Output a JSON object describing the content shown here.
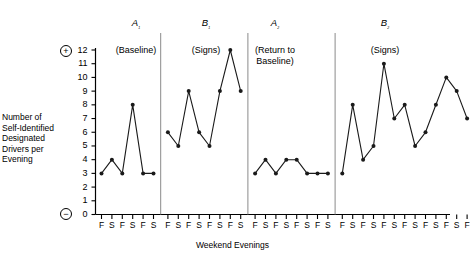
{
  "chart_data": {
    "type": "line",
    "title": "",
    "xlabel": "Weekend Evenings",
    "ylabel": "Number of Self-Identified Designated Drivers per Evening",
    "ylim": [
      0,
      12
    ],
    "yticks": [
      0,
      1,
      2,
      3,
      4,
      5,
      6,
      7,
      8,
      9,
      10,
      11,
      12
    ],
    "grid": false,
    "legend": "none",
    "x_tick_labels": [
      "F",
      "S",
      "F",
      "S",
      "F",
      "S",
      "F",
      "S",
      "F",
      "S",
      "F",
      "S",
      "F",
      "S",
      "F",
      "S",
      "F",
      "S",
      "F",
      "S",
      "F",
      "S",
      "F",
      "S",
      "F",
      "S",
      "F",
      "S",
      "F",
      "S",
      "F",
      "S",
      "F",
      "S"
    ],
    "axis_markers": {
      "top": "+",
      "bottom": "−"
    },
    "phases": [
      {
        "name": "A",
        "subscript": "1",
        "condition": "(Baseline)",
        "values": [
          3,
          4,
          3,
          8,
          3,
          3
        ],
        "x_labels": [
          "F",
          "S",
          "F",
          "S",
          "F",
          "S"
        ]
      },
      {
        "name": "B",
        "subscript": "1",
        "condition": "(Signs)",
        "values": [
          6,
          5,
          9,
          6,
          5,
          9,
          12,
          9
        ],
        "x_labels": [
          "F",
          "S",
          "F",
          "S",
          "F",
          "S",
          "F",
          "S"
        ]
      },
      {
        "name": "A",
        "subscript": "2",
        "condition": "(Return to Baseline)",
        "values": [
          3,
          4,
          3,
          4,
          4,
          3,
          3,
          3
        ],
        "x_labels": [
          "F",
          "S",
          "F",
          "S",
          "F",
          "S",
          "F",
          "S"
        ]
      },
      {
        "name": "B",
        "subscript": "2",
        "condition": "(Signs)",
        "values": [
          3,
          8,
          4,
          5,
          11,
          7,
          8,
          5,
          6,
          8,
          10,
          9,
          7
        ],
        "x_labels": [
          "F",
          "S",
          "F",
          "S",
          "F",
          "S",
          "F",
          "S",
          "F",
          "S",
          "F",
          "S",
          "F"
        ]
      }
    ],
    "colors": {
      "line": "#1a1a1a",
      "marker": "#1a1a1a",
      "axis": "#000000",
      "divider": "#8a8a8a"
    }
  }
}
